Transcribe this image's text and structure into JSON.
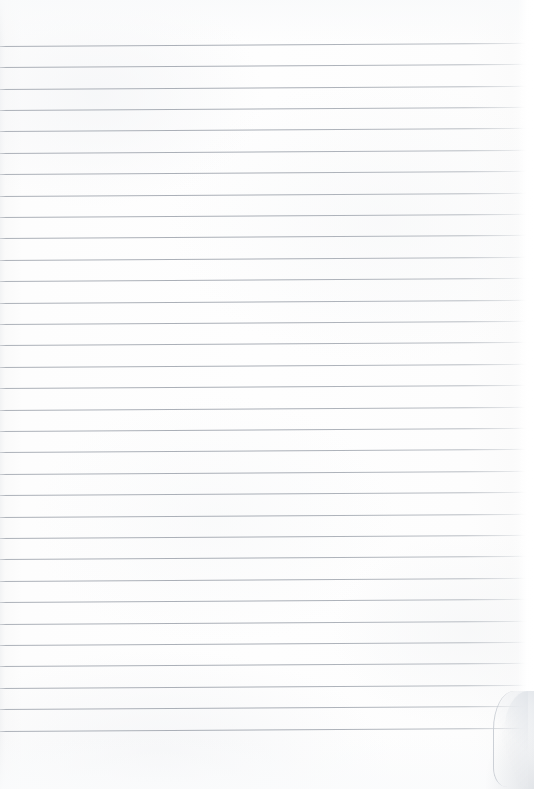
{
  "document": {
    "type": "scanned-ruled-notebook-page",
    "title": "Blank Ruled Notebook Page",
    "written_content": "",
    "page_number": "",
    "header_text": "",
    "footer_text": "",
    "background_color": "#fdfdfd",
    "rule_color": "#aab0b8",
    "page_width_px": 534,
    "page_height_px": 789
  },
  "ruling": {
    "line_count": 33,
    "first_line_y": 46,
    "line_spacing_px": 21.4,
    "line_thickness_px": 1,
    "line_start_x": 0,
    "line_end_x": 528,
    "tilt_degrees": -0.35,
    "lines": [
      {
        "index": 1,
        "y": 46,
        "text": ""
      },
      {
        "index": 2,
        "y": 67,
        "text": ""
      },
      {
        "index": 3,
        "y": 89,
        "text": ""
      },
      {
        "index": 4,
        "y": 110,
        "text": ""
      },
      {
        "index": 5,
        "y": 131,
        "text": ""
      },
      {
        "index": 6,
        "y": 153,
        "text": ""
      },
      {
        "index": 7,
        "y": 174,
        "text": ""
      },
      {
        "index": 8,
        "y": 196,
        "text": ""
      },
      {
        "index": 9,
        "y": 217,
        "text": ""
      },
      {
        "index": 10,
        "y": 238,
        "text": ""
      },
      {
        "index": 11,
        "y": 260,
        "text": ""
      },
      {
        "index": 12,
        "y": 281,
        "text": ""
      },
      {
        "index": 13,
        "y": 303,
        "text": ""
      },
      {
        "index": 14,
        "y": 324,
        "text": ""
      },
      {
        "index": 15,
        "y": 345,
        "text": ""
      },
      {
        "index": 16,
        "y": 367,
        "text": ""
      },
      {
        "index": 17,
        "y": 388,
        "text": ""
      },
      {
        "index": 18,
        "y": 410,
        "text": ""
      },
      {
        "index": 19,
        "y": 431,
        "text": ""
      },
      {
        "index": 20,
        "y": 452,
        "text": ""
      },
      {
        "index": 21,
        "y": 474,
        "text": ""
      },
      {
        "index": 22,
        "y": 495,
        "text": ""
      },
      {
        "index": 23,
        "y": 517,
        "text": ""
      },
      {
        "index": 24,
        "y": 538,
        "text": ""
      },
      {
        "index": 25,
        "y": 559,
        "text": ""
      },
      {
        "index": 26,
        "y": 581,
        "text": ""
      },
      {
        "index": 27,
        "y": 602,
        "text": ""
      },
      {
        "index": 28,
        "y": 624,
        "text": ""
      },
      {
        "index": 29,
        "y": 645,
        "text": ""
      },
      {
        "index": 30,
        "y": 666,
        "text": ""
      },
      {
        "index": 31,
        "y": 688,
        "text": ""
      },
      {
        "index": 32,
        "y": 709,
        "text": ""
      },
      {
        "index": 33,
        "y": 731,
        "text": ""
      }
    ]
  },
  "margins": {
    "top_margin_px": 46,
    "bottom_margin_px": 58,
    "left_margin_px": 0,
    "right_margin_px": 6
  },
  "scan_artifacts": {
    "page_curl_corner": "bottom-right",
    "edge_shadow_left": true,
    "edge_fade_right": true
  }
}
